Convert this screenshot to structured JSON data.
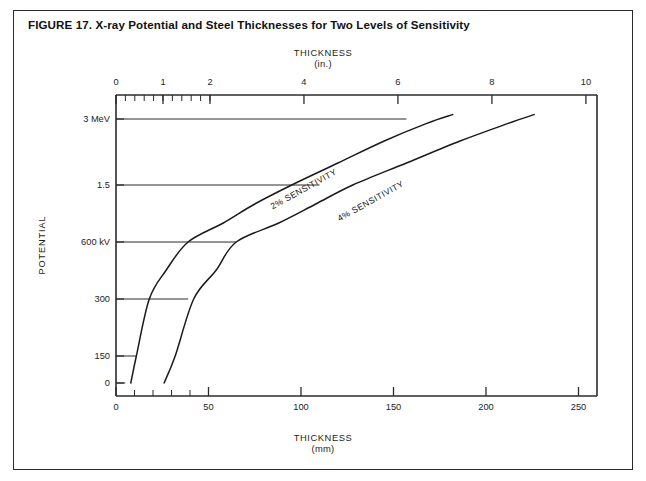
{
  "figure": {
    "title": "FIGURE 17. X-ray Potential and Steel Thicknesses for Two Levels of Sensitivity",
    "border_color": "#2b2b2b",
    "background": "#ffffff"
  },
  "top_axis": {
    "caption": "THICKNESS",
    "unit": "(in.)",
    "labels": [
      "0",
      "1",
      "2",
      "4",
      "6",
      "8",
      "10"
    ]
  },
  "bottom_axis": {
    "caption": "THICKNESS",
    "unit": "(mm)",
    "labels": [
      "0",
      "50",
      "100",
      "150",
      "200",
      "250"
    ]
  },
  "y_axis": {
    "caption": "POTENTIAL",
    "labels": [
      "3 MeV",
      "1.5",
      "600 kV",
      "300",
      "150",
      "0"
    ]
  },
  "curves": {
    "sensitivity_2": "2% SENSITIVITY",
    "sensitivity_4": "4% SENSITIVITY"
  },
  "chart_data": {
    "type": "line",
    "title": "FIGURE 17. X-ray Potential and Steel Thicknesses for Two Levels of Sensitivity",
    "xlabel": "THICKNESS (mm)",
    "ylabel": "POTENTIAL",
    "xlabel_secondary": "THICKNESS (in.)",
    "grid": false,
    "legend": "inline curve labels",
    "x_axis_bottom": {
      "label": "THICKNESS (mm)",
      "ticks": [
        0,
        50,
        100,
        150,
        200,
        250
      ],
      "minor_tick_interval": 10,
      "minor_tick_range": [
        0,
        50
      ],
      "range": [
        0,
        260
      ]
    },
    "x_axis_top": {
      "label": "THICKNESS (in.)",
      "ticks": [
        0,
        1,
        2,
        4,
        6,
        8,
        10
      ],
      "minor_tick_interval": 0.2,
      "minor_tick_range": [
        0,
        2
      ],
      "range": [
        0,
        10.2
      ]
    },
    "y_axis": {
      "label": "POTENTIAL",
      "tick_labels": [
        "0",
        "150",
        "300",
        "600 kV",
        "1.5",
        "3 MeV"
      ],
      "tick_values_kv": [
        0,
        150,
        300,
        600,
        1500,
        3000
      ],
      "scale": "nonlinear (compressed at high potential)",
      "range_kv": [
        0,
        3000
      ]
    },
    "reference_lines": [
      {
        "level": "3 MeV",
        "extends_to_mm": 157,
        "extends_to_in": 6.2
      },
      {
        "level": "1.5",
        "extends_to_mm": 110,
        "extends_to_in": 4.3
      },
      {
        "level": "600 kV",
        "extends_to_mm": 65,
        "extends_to_in": 2.6
      },
      {
        "level": "300",
        "extends_to_mm": 39,
        "extends_to_in": 1.5
      },
      {
        "level": "150",
        "extends_to_mm": 11,
        "extends_to_in": 0.45
      },
      {
        "level": "0",
        "extends_to_mm": 5,
        "extends_to_in": 0.2
      }
    ],
    "series": [
      {
        "name": "2% SENSITIVITY",
        "points_mm_kv": [
          [
            8,
            0
          ],
          [
            11,
            150
          ],
          [
            18,
            300
          ],
          [
            27,
            450
          ],
          [
            39,
            600
          ],
          [
            58,
            900
          ],
          [
            75,
            1200
          ],
          [
            95,
            1500
          ],
          [
            120,
            2000
          ],
          [
            145,
            2500
          ],
          [
            168,
            2900
          ],
          [
            182,
            3100
          ]
        ]
      },
      {
        "name": "4% SENSITIVITY",
        "points_mm_kv": [
          [
            26,
            0
          ],
          [
            32,
            150
          ],
          [
            42,
            300
          ],
          [
            54,
            450
          ],
          [
            65,
            600
          ],
          [
            88,
            900
          ],
          [
            108,
            1200
          ],
          [
            128,
            1500
          ],
          [
            157,
            2000
          ],
          [
            186,
            2500
          ],
          [
            212,
            2900
          ],
          [
            226,
            3100
          ]
        ]
      }
    ]
  }
}
